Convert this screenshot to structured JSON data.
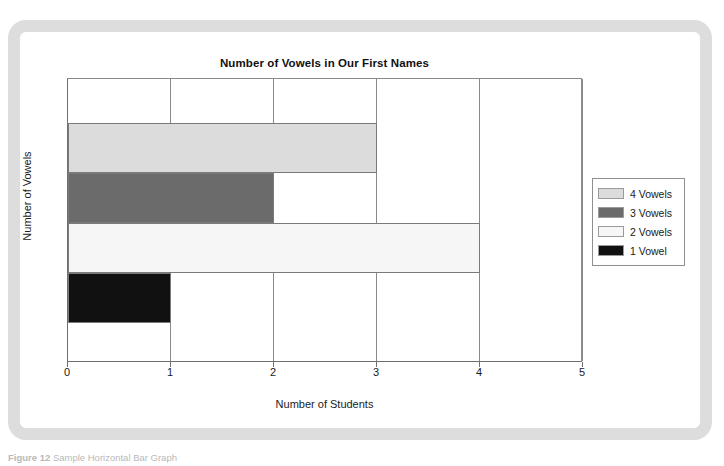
{
  "figure": {
    "caption_label": "Figure 12",
    "caption_text": "Sample Horizontal Bar Graph"
  },
  "chart_data": {
    "type": "bar",
    "orientation": "horizontal",
    "title": "Number of Vowels in Our First Names",
    "xlabel": "Number of Students",
    "ylabel": "Number of Vowels",
    "xlim": [
      0,
      5
    ],
    "x_ticks": [
      "0",
      "1",
      "2",
      "3",
      "4",
      "5"
    ],
    "grid": true,
    "legend_position": "right",
    "categories": [
      "4 Vowels",
      "3 Vowels",
      "2 Vowels",
      "1 Vowel"
    ],
    "values": [
      3,
      2,
      4,
      1
    ],
    "colors": [
      "#dcdcdc",
      "#6b6b6b",
      "#f6f6f6",
      "#111111"
    ],
    "series": [
      {
        "name": "4 Vowels",
        "value": 3,
        "color": "#dcdcdc"
      },
      {
        "name": "3 Vowels",
        "value": 2,
        "color": "#6b6b6b"
      },
      {
        "name": "2 Vowels",
        "value": 4,
        "color": "#f6f6f6"
      },
      {
        "name": "1 Vowel",
        "value": 1,
        "color": "#111111"
      }
    ]
  }
}
